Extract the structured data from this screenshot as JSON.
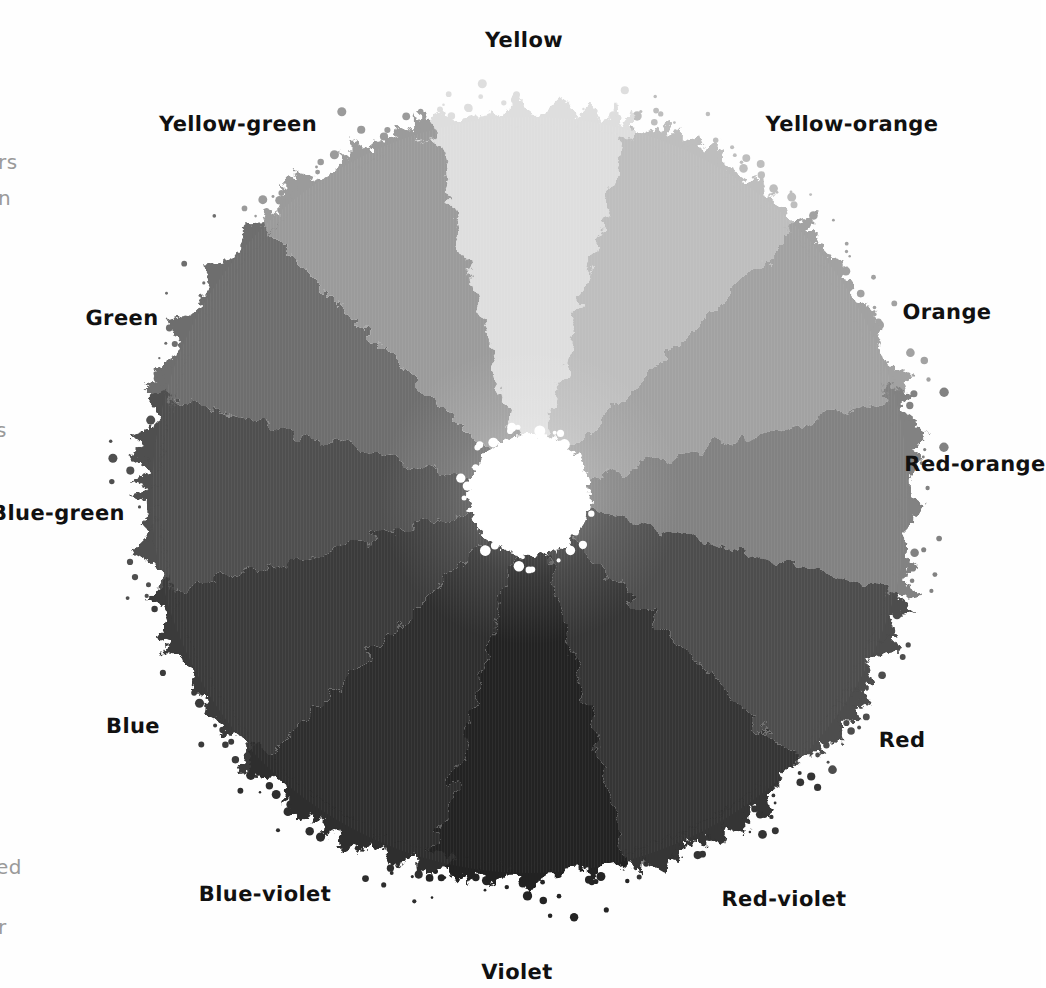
{
  "page": {
    "background_color": "#ffffff",
    "label_color": "#111111",
    "width": 1041,
    "height": 988
  },
  "wheel": {
    "center_x": 530,
    "center_y": 495,
    "outer_radius": 380,
    "inner_radius": 57,
    "segment_count": 12,
    "center_hole_color": "#ffffff",
    "note": "Grayscale print reproduction of a 12-hue artist's color wheel with painted/splattered edges"
  },
  "chart_data": {
    "type": "pie",
    "categories": [
      "Yellow",
      "Yellow-orange",
      "Orange",
      "Red-orange",
      "Red",
      "Red-violet",
      "Violet",
      "Blue-violet",
      "Blue",
      "Blue-green",
      "Green",
      "Yellow-green"
    ],
    "values": [
      30,
      30,
      30,
      30,
      30,
      30,
      30,
      30,
      30,
      30,
      30,
      30
    ],
    "colors": [
      "#dedede",
      "#bebebe",
      "#a2a2a2",
      "#828282",
      "#4d4d4d",
      "#343434",
      "#242424",
      "#2e2e2e",
      "#3b3b3b",
      "#4f4f4f",
      "#6e6e6e",
      "#9b9b9b"
    ],
    "start_angle_deg": -15,
    "legend": "none",
    "grid": false
  },
  "labels": [
    {
      "id": "yellow",
      "text": "Yellow",
      "x": 524,
      "y": 40
    },
    {
      "id": "yellow-green",
      "text": "Yellow-green",
      "x": 238,
      "y": 124
    },
    {
      "id": "yellow-orange",
      "text": "Yellow-orange",
      "x": 852,
      "y": 124
    },
    {
      "id": "green",
      "text": "Green",
      "x": 122,
      "y": 318
    },
    {
      "id": "orange",
      "text": "Orange",
      "x": 947,
      "y": 312
    },
    {
      "id": "red-orange",
      "text": "Red-orange",
      "x": 975,
      "y": 464
    },
    {
      "id": "blue-green",
      "text": "Blue-green",
      "x": 58,
      "y": 513
    },
    {
      "id": "blue",
      "text": "Blue",
      "x": 133,
      "y": 726
    },
    {
      "id": "red",
      "text": "Red",
      "x": 902,
      "y": 740
    },
    {
      "id": "blue-violet",
      "text": "Blue-violet",
      "x": 265,
      "y": 894
    },
    {
      "id": "red-violet",
      "text": "Red-violet",
      "x": 784,
      "y": 899
    },
    {
      "id": "violet",
      "text": "Violet",
      "x": 517,
      "y": 972
    }
  ],
  "edge_fragments": [
    {
      "id": "frag-rs",
      "text": "rs",
      "x": -2,
      "y": 150
    },
    {
      "id": "frag-n",
      "text": "n",
      "x": -2,
      "y": 186
    },
    {
      "id": "frag-s",
      "text": "s",
      "x": -4,
      "y": 418
    },
    {
      "id": "frag-ed",
      "text": "ed",
      "x": -4,
      "y": 855
    },
    {
      "id": "frag-r",
      "text": "r",
      "x": -2,
      "y": 915
    }
  ]
}
